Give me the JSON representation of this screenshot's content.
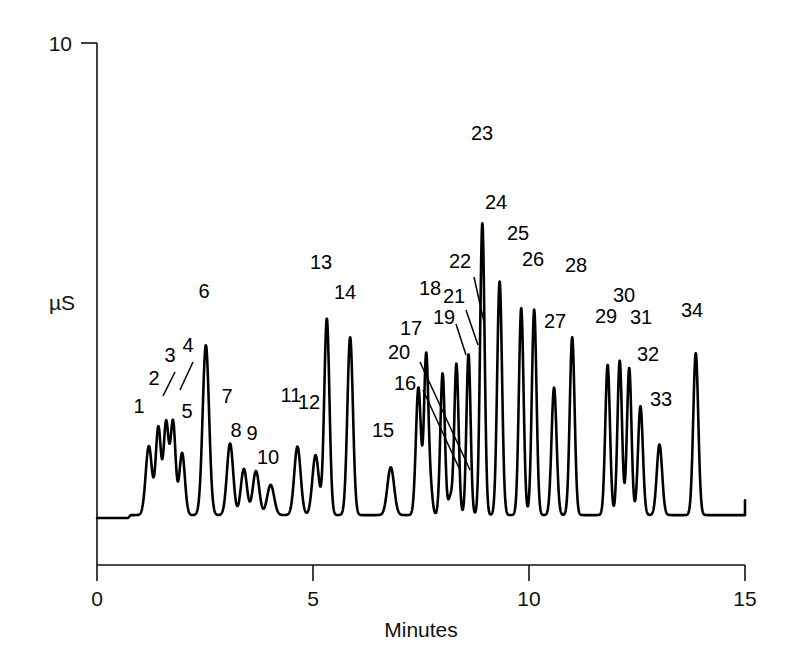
{
  "chart_data": {
    "type": "line",
    "title": "",
    "subtitle": "",
    "xlabel": "Minutes",
    "ylabel": "µS",
    "xlim": [
      0,
      15
    ],
    "ylim": [
      0,
      10
    ],
    "xticks": [
      0,
      5,
      10,
      15
    ],
    "xtick_labels": [
      "0",
      "5",
      "10",
      "15"
    ],
    "yticks": [
      10
    ],
    "ytick_labels": [
      "10"
    ],
    "grid": false,
    "legend": null,
    "baseline_value": 1.05,
    "series": [
      {
        "name": "conductivity",
        "x_unit": "minutes",
        "y_unit": "µS",
        "peaks": [
          {
            "id": 1,
            "x": 1.2,
            "height": 2.35,
            "width": 0.072,
            "label": "1"
          },
          {
            "id": 2,
            "x": 1.42,
            "height": 2.7,
            "width": 0.06,
            "label": "2"
          },
          {
            "id": 3,
            "x": 1.6,
            "height": 2.78,
            "width": 0.058,
            "label": "3"
          },
          {
            "id": 4,
            "x": 1.76,
            "height": 2.8,
            "width": 0.058,
            "label": "4"
          },
          {
            "id": 5,
            "x": 1.97,
            "height": 2.22,
            "width": 0.064,
            "label": "5"
          },
          {
            "id": 6,
            "x": 2.52,
            "height": 4.25,
            "width": 0.074,
            "label": "6"
          },
          {
            "id": 7,
            "x": 3.08,
            "height": 2.4,
            "width": 0.072,
            "label": "7"
          },
          {
            "id": 8,
            "x": 3.4,
            "height": 1.92,
            "width": 0.07,
            "label": "8"
          },
          {
            "id": 9,
            "x": 3.68,
            "height": 1.88,
            "width": 0.074,
            "label": "9"
          },
          {
            "id": 10,
            "x": 4.02,
            "height": 1.62,
            "width": 0.08,
            "label": "10"
          },
          {
            "id": 11,
            "x": 4.64,
            "height": 2.34,
            "width": 0.074,
            "label": "11"
          },
          {
            "id": 12,
            "x": 5.06,
            "height": 2.18,
            "width": 0.074,
            "label": "12"
          },
          {
            "id": 13,
            "x": 5.32,
            "height": 4.75,
            "width": 0.06,
            "label": "13"
          },
          {
            "id": 14,
            "x": 5.86,
            "height": 4.4,
            "width": 0.064,
            "label": "14"
          },
          {
            "id": 15,
            "x": 6.8,
            "height": 1.95,
            "width": 0.078,
            "label": "15"
          },
          {
            "id": 16,
            "x": 7.72,
            "height": 1.52,
            "width": 0.046,
            "label": "16"
          },
          {
            "id": 17,
            "x": 7.44,
            "height": 3.45,
            "width": 0.058,
            "label": "17"
          },
          {
            "id": 18,
            "x": 7.62,
            "height": 4.05,
            "width": 0.05,
            "label": "18"
          },
          {
            "id": 19,
            "x": 8.0,
            "height": 3.72,
            "width": 0.052,
            "label": "19"
          },
          {
            "id": 20,
            "x": 8.18,
            "height": 1.38,
            "width": 0.046,
            "label": "20"
          },
          {
            "id": 21,
            "x": 8.32,
            "height": 3.9,
            "width": 0.05,
            "label": "21"
          },
          {
            "id": 22,
            "x": 8.6,
            "height": 4.08,
            "width": 0.048,
            "label": "22"
          },
          {
            "id": 23,
            "x": 8.92,
            "height": 6.55,
            "width": 0.052,
            "label": "23"
          },
          {
            "id": 24,
            "x": 9.32,
            "height": 5.45,
            "width": 0.056,
            "label": "24"
          },
          {
            "id": 25,
            "x": 9.82,
            "height": 4.95,
            "width": 0.054,
            "label": "25"
          },
          {
            "id": 26,
            "x": 10.12,
            "height": 4.92,
            "width": 0.054,
            "label": "26"
          },
          {
            "id": 27,
            "x": 10.58,
            "height": 3.45,
            "width": 0.058,
            "label": "27"
          },
          {
            "id": 28,
            "x": 11.0,
            "height": 4.4,
            "width": 0.056,
            "label": "28"
          },
          {
            "id": 29,
            "x": 11.82,
            "height": 3.88,
            "width": 0.054,
            "label": "29"
          },
          {
            "id": 30,
            "x": 12.1,
            "height": 3.96,
            "width": 0.052,
            "label": "30"
          },
          {
            "id": 31,
            "x": 12.32,
            "height": 3.82,
            "width": 0.052,
            "label": "31"
          },
          {
            "id": 32,
            "x": 12.58,
            "height": 3.1,
            "width": 0.056,
            "label": "32"
          },
          {
            "id": 33,
            "x": 13.02,
            "height": 2.38,
            "width": 0.062,
            "label": "33"
          },
          {
            "id": 34,
            "x": 13.86,
            "height": 4.1,
            "width": 0.058,
            "label": "34"
          }
        ]
      }
    ],
    "peak_labels": [
      {
        "label": "1",
        "x": 139,
        "y": 413,
        "leader": null
      },
      {
        "label": "2",
        "x": 154,
        "y": 385,
        "leader": null
      },
      {
        "label": "3",
        "x": 170,
        "y": 362,
        "leader": [
          [
            175,
            372
          ],
          [
            163,
            396
          ]
        ]
      },
      {
        "label": "4",
        "x": 188,
        "y": 352,
        "leader": [
          [
            193,
            362
          ],
          [
            180,
            390
          ]
        ]
      },
      {
        "label": "5",
        "x": 187,
        "y": 418,
        "leader": null
      },
      {
        "label": "6",
        "x": 204,
        "y": 298,
        "leader": null
      },
      {
        "label": "7",
        "x": 227,
        "y": 403,
        "leader": null
      },
      {
        "label": "8",
        "x": 236,
        "y": 437,
        "leader": null
      },
      {
        "label": "9",
        "x": 252,
        "y": 440,
        "leader": null
      },
      {
        "label": "10",
        "x": 268,
        "y": 464,
        "leader": null
      },
      {
        "label": "11",
        "x": 291,
        "y": 402,
        "leader": null
      },
      {
        "label": "12",
        "x": 309,
        "y": 409,
        "leader": null
      },
      {
        "label": "13",
        "x": 321,
        "y": 269,
        "leader": null
      },
      {
        "label": "14",
        "x": 345,
        "y": 299,
        "leader": null
      },
      {
        "label": "15",
        "x": 383,
        "y": 437,
        "leader": null
      },
      {
        "label": "16",
        "x": 405,
        "y": 390,
        "leader": [
          [
            423,
            390
          ],
          [
            459,
            468
          ]
        ]
      },
      {
        "label": "17",
        "x": 411,
        "y": 335,
        "leader": null
      },
      {
        "label": "18",
        "x": 430,
        "y": 295,
        "leader": null
      },
      {
        "label": "19",
        "x": 444,
        "y": 324,
        "leader": [
          [
            456,
            324
          ],
          [
            466,
            355
          ]
        ]
      },
      {
        "label": "20",
        "x": 399,
        "y": 359,
        "leader": [
          [
            420,
            362
          ],
          [
            470,
            470
          ]
        ]
      },
      {
        "label": "21",
        "x": 454,
        "y": 303,
        "leader": [
          [
            466,
            310
          ],
          [
            478,
            345
          ]
        ]
      },
      {
        "label": "22",
        "x": 460,
        "y": 268,
        "leader": [
          [
            474,
            277
          ],
          [
            484,
            322
          ]
        ]
      },
      {
        "label": "23",
        "x": 482,
        "y": 140,
        "leader": null
      },
      {
        "label": "24",
        "x": 496,
        "y": 209,
        "leader": null
      },
      {
        "label": "25",
        "x": 518,
        "y": 240,
        "leader": null
      },
      {
        "label": "26",
        "x": 533,
        "y": 266,
        "leader": null
      },
      {
        "label": "27",
        "x": 555,
        "y": 328,
        "leader": null
      },
      {
        "label": "28",
        "x": 576,
        "y": 272,
        "leader": null
      },
      {
        "label": "29",
        "x": 606,
        "y": 323,
        "leader": null
      },
      {
        "label": "30",
        "x": 624,
        "y": 302,
        "leader": null
      },
      {
        "label": "31",
        "x": 641,
        "y": 324,
        "leader": null
      },
      {
        "label": "32",
        "x": 648,
        "y": 361,
        "leader": null
      },
      {
        "label": "33",
        "x": 661,
        "y": 406,
        "leader": null
      },
      {
        "label": "34",
        "x": 692,
        "y": 317,
        "leader": null
      }
    ]
  },
  "axes": {
    "x_title": "Minutes",
    "y_title": "µS",
    "x_tick_labels": [
      "0",
      "5",
      "10",
      "15"
    ],
    "y_tick_labels": [
      "10"
    ]
  }
}
